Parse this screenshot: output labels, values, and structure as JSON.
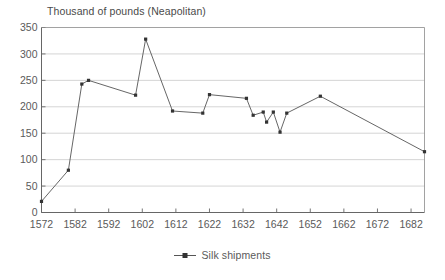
{
  "chart_data": {
    "type": "line",
    "title": "Thousand of pounds (Neapolitan)",
    "xlabel": "",
    "ylabel": "",
    "xlim": [
      1572,
      1686
    ],
    "ylim": [
      0,
      350
    ],
    "ytick_values": [
      0,
      50,
      100,
      150,
      200,
      250,
      300,
      350
    ],
    "ytick_labels": [
      "0",
      "50",
      "100",
      "150",
      "200",
      "250",
      "300",
      "350"
    ],
    "xtick_values": [
      1572,
      1582,
      1592,
      1602,
      1612,
      1622,
      1632,
      1642,
      1652,
      1662,
      1672,
      1682
    ],
    "xtick_labels": [
      "1572",
      "1582",
      "1592",
      "1602",
      "1612",
      "1622",
      "1632",
      "1642",
      "1652",
      "1662",
      "1672",
      "1682"
    ],
    "grid": "horizontal",
    "legend_position": "bottom-center",
    "series": [
      {
        "name": "Silk shipments",
        "color": "#555555",
        "marker": "square",
        "x": [
          1572,
          1580,
          1584,
          1586,
          1600,
          1603,
          1611,
          1620,
          1622,
          1633,
          1635,
          1638,
          1639,
          1641,
          1643,
          1645,
          1655,
          1686
        ],
        "values": [
          21,
          80,
          243,
          250,
          222,
          328,
          192,
          188,
          223,
          216,
          184,
          190,
          171,
          190,
          152,
          188,
          220,
          115
        ]
      }
    ]
  },
  "legend": {
    "marker_name": "line-marker-square",
    "label": "Silk shipments"
  }
}
